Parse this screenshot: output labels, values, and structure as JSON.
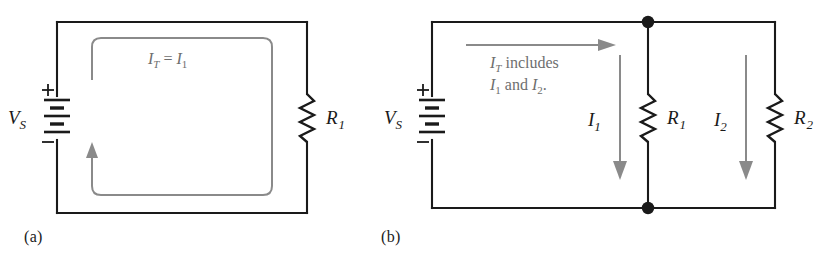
{
  "figure": {
    "type": "circuit-diagram",
    "panels": [
      {
        "id": "a",
        "caption": "(a)",
        "topology": "series",
        "source": {
          "label_main": "V",
          "label_sub": "S",
          "plus": "+",
          "minus": "−"
        },
        "resistors": [
          {
            "label_main": "R",
            "label_sub": "1"
          }
        ],
        "current_annotations": [
          {
            "id": "total-current-equation",
            "parts": [
              {
                "text": "I",
                "style": "italic"
              },
              {
                "text": "T",
                "style": "italic-sub"
              },
              {
                "text": " = ",
                "style": "roman"
              },
              {
                "text": "I",
                "style": "italic"
              },
              {
                "text": "1",
                "style": "roman-sub"
              }
            ],
            "plain": "IT = I1"
          }
        ],
        "flow_arrows": [
          {
            "id": "loop-current-arrow",
            "direction": "counterclockwise",
            "shape": "rounded-loop"
          }
        ]
      },
      {
        "id": "b",
        "caption": "(b)",
        "topology": "parallel",
        "source": {
          "label_main": "V",
          "label_sub": "S",
          "plus": "+",
          "minus": "−"
        },
        "resistors": [
          {
            "label_main": "R",
            "label_sub": "1"
          },
          {
            "label_main": "R",
            "label_sub": "2"
          }
        ],
        "branch_currents": [
          {
            "label_main": "I",
            "label_sub": "1"
          },
          {
            "label_main": "I",
            "label_sub": "2"
          }
        ],
        "current_annotations": [
          {
            "id": "total-current-note",
            "line1_parts": [
              {
                "text": "I",
                "style": "italic"
              },
              {
                "text": "T",
                "style": "italic-sub"
              },
              {
                "text": " includes",
                "style": "roman"
              }
            ],
            "line2_parts": [
              {
                "text": "I",
                "style": "italic"
              },
              {
                "text": "1",
                "style": "roman-sub"
              },
              {
                "text": " and ",
                "style": "roman"
              },
              {
                "text": "I",
                "style": "italic"
              },
              {
                "text": "2",
                "style": "roman-sub"
              },
              {
                "text": ".",
                "style": "roman"
              }
            ],
            "plain": "IT includes I1 and I2."
          }
        ],
        "flow_arrows": [
          {
            "id": "total-current-arrow",
            "direction": "right"
          },
          {
            "id": "branch-1-current-arrow",
            "direction": "down"
          },
          {
            "id": "branch-2-current-arrow",
            "direction": "down"
          }
        ],
        "junction_nodes": 2
      }
    ]
  },
  "colors": {
    "wire": "#1a1a1a",
    "flow_arrow": "#8a8a8a",
    "annotation_text": "#6e6e6e",
    "label_text": "#1a1a1a",
    "background": "#ffffff"
  }
}
